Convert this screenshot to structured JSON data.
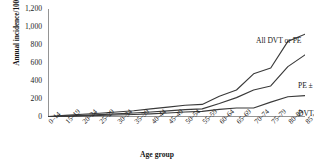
{
  "chart_data": {
    "type": "line",
    "title": "",
    "xlabel": "Age group",
    "ylabel": "Annual incidence/100,000",
    "ylim": [
      0,
      1200
    ],
    "ytick_values": [
      0,
      200,
      400,
      600,
      800,
      1000,
      1200
    ],
    "ytick_labels": [
      "0",
      "200",
      "400",
      "600",
      "800",
      "1,000",
      "1,200"
    ],
    "grid": false,
    "legend_position": "inline-right",
    "categories": [
      "0–14",
      "15–19",
      "20–24",
      "25–29",
      "30–34",
      "35–39",
      "40–44",
      "45–49",
      "50–54",
      "55–59",
      "60–64",
      "65–69",
      "70–74",
      "75–79",
      "80–84",
      "85 +"
    ],
    "series": [
      {
        "name": "All DVT or PE",
        "values": [
          5,
          18,
          30,
          42,
          55,
          70,
          90,
          110,
          130,
          140,
          230,
          300,
          480,
          545,
          840,
          920
        ]
      },
      {
        "name": "PE ± DVT",
        "values": [
          3,
          10,
          18,
          26,
          34,
          44,
          56,
          68,
          82,
          90,
          150,
          215,
          300,
          345,
          560,
          690
        ]
      },
      {
        "name": "DVT alone",
        "values": [
          2,
          7,
          12,
          17,
          22,
          28,
          35,
          44,
          55,
          62,
          85,
          100,
          100,
          165,
          225,
          238
        ]
      }
    ]
  },
  "labels": {
    "series_all": "All DVT or PE",
    "series_pe": "PE ± DVT",
    "series_dvt": "DVT alone"
  }
}
